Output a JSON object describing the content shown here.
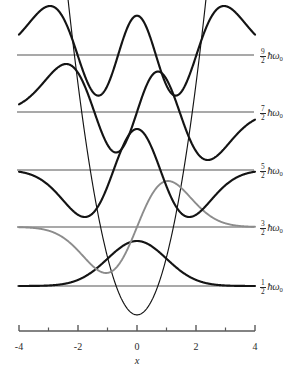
{
  "figure": {
    "title": "",
    "axis_name": "x",
    "colors": {
      "wave_dark": "#141414",
      "wave_gray": "#8c8c8c",
      "baseline": "#8c8c8c",
      "potential": "#141414",
      "axis": "#5a5a5a",
      "text": "#2a2a2a"
    }
  },
  "xaxis": {
    "min": -4,
    "max": 4,
    "major_ticks": [
      -4,
      -2,
      0,
      2,
      4
    ],
    "major_tick_labels": [
      "-4",
      "-2",
      "0",
      "2",
      "4"
    ],
    "minor_ticks": [
      -3,
      -1,
      1,
      3
    ],
    "label": "x"
  },
  "levels": [
    {
      "n": 4,
      "numerator": "9",
      "denominator": "2",
      "energy_symbol": "ħω",
      "subscript": "0",
      "label_text": "9/2 ħω₀",
      "baseline_y": 55,
      "nodes": 4,
      "color": "#141414"
    },
    {
      "n": 3,
      "numerator": "7",
      "denominator": "2",
      "energy_symbol": "ħω",
      "subscript": "0",
      "label_text": "7/2 ħω₀",
      "baseline_y": 112,
      "nodes": 3,
      "color": "#141414"
    },
    {
      "n": 2,
      "numerator": "5",
      "denominator": "2",
      "energy_symbol": "ħω",
      "subscript": "0",
      "label_text": "5/2 ħω₀",
      "baseline_y": 170,
      "nodes": 2,
      "color": "#141414"
    },
    {
      "n": 1,
      "numerator": "3",
      "denominator": "2",
      "energy_symbol": "ħω",
      "subscript": "0",
      "label_text": "3/2 ħω₀",
      "baseline_y": 227,
      "nodes": 1,
      "color": "#8c8c8c"
    },
    {
      "n": 0,
      "numerator": "1",
      "denominator": "2",
      "energy_symbol": "ħω",
      "subscript": "0",
      "label_text": "1/2 ħω₀",
      "baseline_y": 286,
      "nodes": 0,
      "color": "#141414"
    }
  ],
  "chart_data": {
    "type": "line",
    "title": "",
    "xlabel": "x",
    "ylabel": "",
    "xlim": [
      -4,
      4
    ],
    "grid": false,
    "legend": "none",
    "potential": {
      "name": "parabolic potential V(x)",
      "formula": "V = x^2",
      "vertex": [
        0,
        0
      ],
      "color": "#141414"
    },
    "series": [
      {
        "name": "n=0  (1/2 hbar omega_0)",
        "n": 0,
        "energy": 0.5,
        "energy_label": "1/2 ħω₀",
        "nodes": 0,
        "color": "#141414",
        "x": [
          -4,
          -3.5,
          -3,
          -2.5,
          -2,
          -1.5,
          -1,
          -0.5,
          0,
          0.5,
          1,
          1.5,
          2,
          2.5,
          3,
          3.5,
          4
        ],
        "y": [
          0.0,
          0.002,
          0.011,
          0.044,
          0.135,
          0.325,
          0.607,
          0.882,
          1.0,
          0.882,
          0.607,
          0.325,
          0.135,
          0.044,
          0.011,
          0.002,
          0.0
        ]
      },
      {
        "name": "n=1  (3/2 hbar omega_0)",
        "n": 1,
        "energy": 1.5,
        "energy_label": "3/2 ħω₀",
        "nodes": 1,
        "color": "#8c8c8c",
        "x": [
          -4,
          -3.5,
          -3,
          -2.5,
          -2,
          -1.5,
          -1,
          -0.5,
          0,
          0.5,
          1,
          1.5,
          2,
          2.5,
          3,
          3.5,
          4
        ],
        "y": [
          -0.001,
          -0.009,
          -0.055,
          -0.181,
          -0.46,
          -0.83,
          -1.0,
          -0.757,
          0.0,
          0.757,
          1.0,
          0.83,
          0.46,
          0.181,
          0.055,
          0.009,
          0.001
        ]
      },
      {
        "name": "n=2  (5/2 hbar omega_0)",
        "n": 2,
        "energy": 2.5,
        "energy_label": "5/2 ħω₀",
        "nodes": 2,
        "color": "#141414",
        "x": [
          -4,
          -3.5,
          -3,
          -2.5,
          -2,
          -1.5,
          -1,
          -0.5,
          0,
          0.5,
          1,
          1.5,
          2,
          2.5,
          3,
          3.5,
          4
        ],
        "y": [
          0.005,
          0.035,
          0.142,
          0.33,
          0.503,
          0.398,
          -0.067,
          -0.557,
          -0.78,
          -0.557,
          -0.067,
          0.398,
          0.503,
          0.33,
          0.142,
          0.035,
          0.005
        ]
      },
      {
        "name": "n=3  (7/2 hbar omega_0)",
        "n": 3,
        "energy": 3.5,
        "energy_label": "7/2 ħω₀",
        "nodes": 3,
        "color": "#141414",
        "x": [
          -4,
          -3.5,
          -3,
          -2.5,
          -2,
          -1.5,
          -1,
          -0.5,
          0,
          0.5,
          1,
          1.5,
          2,
          2.5,
          3,
          3.5,
          4
        ],
        "y": [
          -0.02,
          -0.1,
          -0.302,
          -0.504,
          -0.477,
          -0.03,
          0.504,
          0.657,
          0.0,
          -0.657,
          -0.504,
          0.03,
          0.477,
          0.504,
          0.302,
          0.1,
          0.02
        ]
      },
      {
        "name": "n=4  (9/2 hbar omega_0)",
        "n": 4,
        "energy": 4.5,
        "energy_label": "9/2 ħω₀",
        "nodes": 4,
        "color": "#141414",
        "x": [
          -4,
          -3.5,
          -3,
          -2.5,
          -2,
          -1.5,
          -1,
          -0.5,
          0,
          0.5,
          1,
          1.5,
          2,
          2.5,
          3,
          3.5,
          4
        ],
        "y": [
          0.061,
          0.242,
          0.541,
          0.63,
          0.26,
          -0.367,
          -0.562,
          -0.088,
          0.585,
          -0.088,
          -0.562,
          -0.367,
          0.26,
          0.63,
          0.541,
          0.242,
          0.061
        ]
      }
    ]
  }
}
